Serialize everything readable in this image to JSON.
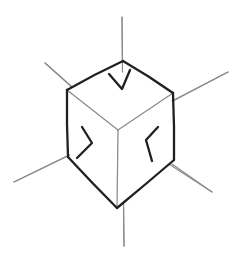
{
  "figure": {
    "background_color": "#ffffff",
    "width": 232,
    "height": 261,
    "caption": ""
  },
  "style": {
    "dark_stroke_color": "#231f20",
    "light_stroke_color": "#8a8a8f",
    "face_fill_color": "#ffffff",
    "dark_stroke_width": 2.3,
    "light_stroke_width": 1.15,
    "arrow_stroke_width": 2.3
  },
  "cube": {
    "name": "cube",
    "projection": "isometric",
    "vertices": {
      "top_back": [
        123,
        61
      ],
      "top_left": [
        67,
        90
      ],
      "top_right": [
        173,
        93
      ],
      "top_front": [
        118,
        130
      ],
      "bottom_left": [
        68,
        157
      ],
      "bottom_right": [
        174,
        160
      ],
      "bottom_front": [
        117,
        208
      ]
    },
    "faces": [
      {
        "name": "top-face",
        "visible": true,
        "points": "123,61 67,90 118,130 173,93"
      },
      {
        "name": "left-face",
        "visible": true,
        "points": "67,90 68,157 117,208 118,130"
      },
      {
        "name": "right-face",
        "visible": true,
        "points": "118,130 117,208 174,160 173,93"
      }
    ],
    "silhouette_path": "M123,61 L67,90 L68,157 L117,208 L174,160 L173,93 Z",
    "interior_edges": [
      {
        "name": "edge-center-vertical",
        "from": [
          118,
          130
        ],
        "to": [
          117,
          208
        ]
      },
      {
        "name": "edge-center-to-top-left",
        "from": [
          118,
          130
        ],
        "to": [
          67,
          90
        ]
      },
      {
        "name": "edge-center-to-top-right",
        "from": [
          118,
          130
        ],
        "to": [
          173,
          93
        ]
      }
    ]
  },
  "axes": [
    {
      "name": "axis-vertical",
      "label": "vertical axis",
      "from": [
        122,
        17
      ],
      "to": [
        124,
        246
      ],
      "orientation": "vertical"
    },
    {
      "name": "axis-upper-left",
      "label": "upper-left axis",
      "from": [
        45,
        63
      ],
      "to": [
        119,
        129
      ],
      "orientation": "diagonal-down-right"
    },
    {
      "name": "axis-upper-right",
      "label": "upper-right axis",
      "from": [
        228,
        72
      ],
      "to": [
        118,
        130
      ],
      "orientation": "diagonal-down-left"
    },
    {
      "name": "axis-lower-left",
      "label": "lower-left axis",
      "from": [
        14,
        182
      ],
      "to": [
        118,
        131
      ],
      "orientation": "diagonal-up-right"
    },
    {
      "name": "axis-lower-right",
      "label": "lower-right axis",
      "from": [
        212,
        192
      ],
      "to": [
        118,
        131
      ],
      "orientation": "diagonal-up-left"
    }
  ],
  "arrows": [
    {
      "name": "arrow-top",
      "label": "downward force on top face",
      "direction": "down",
      "tip": [
        122,
        89
      ],
      "head_path": "M109,74 L122,89 L130,70"
    },
    {
      "name": "arrow-left",
      "label": "rightward force on left face",
      "direction": "right",
      "tip": [
        92,
        143
      ],
      "head_path": "M82,127 L92,143 L77,158"
    },
    {
      "name": "arrow-right",
      "label": "leftward force on right face",
      "direction": "left",
      "tip": [
        146,
        140
      ],
      "head_path": "M158,127 L146,140 L152,161"
    }
  ]
}
